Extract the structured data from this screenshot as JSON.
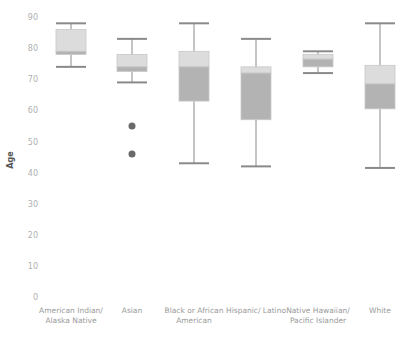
{
  "chart_data": {
    "type": "box",
    "title": "",
    "xlabel": "",
    "ylabel": "Age",
    "ylim": [
      0,
      90
    ],
    "yticks": [
      0,
      10,
      20,
      30,
      40,
      50,
      60,
      70,
      80,
      90
    ],
    "grid": false,
    "legend": null,
    "categories": [
      [
        "American Indian/",
        "Alaska Native"
      ],
      [
        "Asian"
      ],
      [
        "Black or African",
        "American"
      ],
      [
        "Hispanic/ Latino"
      ],
      [
        "Native Hawaiian/",
        "Pacific Islander"
      ],
      [
        "White"
      ]
    ],
    "category_names": [
      "American Indian/ Alaska Native",
      "Asian",
      "Black or African American",
      "Hispanic/ Latino",
      "Native Hawaiian/ Pacific Islander",
      "White"
    ],
    "boxes": [
      {
        "whisker_low": 74,
        "q1": 78,
        "median": 79,
        "q3": 86,
        "whisker_high": 88,
        "outliers": []
      },
      {
        "whisker_low": 69,
        "q1": 72.5,
        "median": 74,
        "q3": 78,
        "whisker_high": 83,
        "outliers": [
          55,
          46
        ]
      },
      {
        "whisker_low": 43,
        "q1": 63,
        "median": 74,
        "q3": 79,
        "whisker_high": 88,
        "outliers": []
      },
      {
        "whisker_low": 42,
        "q1": 57,
        "median": 72,
        "q3": 74,
        "whisker_high": 83,
        "outliers": []
      },
      {
        "whisker_low": 72,
        "q1": 74,
        "median": 76.5,
        "q3": 78,
        "whisker_high": 79,
        "outliers": []
      },
      {
        "whisker_low": 41.5,
        "q1": 60.5,
        "median": 68.5,
        "q3": 74.5,
        "whisker_high": 88,
        "outliers": []
      }
    ]
  },
  "colors": {
    "upper_box": "#dcdcdc",
    "lower_box": "#b3b3b3",
    "box_border": "#c8c8c8",
    "whisker": "#8a8a8a",
    "outlier": "#6a6a6a"
  }
}
